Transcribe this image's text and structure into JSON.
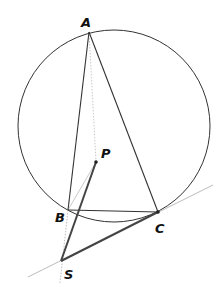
{
  "diagram": {
    "type": "geometry",
    "circle": {
      "cx": 114,
      "cy": 126,
      "r": 96,
      "stroke": "#333333"
    },
    "points": {
      "A": {
        "label": "A",
        "x": 89,
        "y": 32
      },
      "B": {
        "label": "B",
        "x": 68,
        "y": 210
      },
      "C": {
        "label": "C",
        "x": 158,
        "y": 212
      },
      "P": {
        "label": "P",
        "x": 96,
        "y": 162
      },
      "S": {
        "label": "S",
        "x": 61,
        "y": 261
      }
    },
    "segments": [
      {
        "from": "A",
        "to": "B",
        "style": "solid"
      },
      {
        "from": "A",
        "to": "C",
        "style": "solid"
      },
      {
        "from": "B",
        "to": "C",
        "style": "solid"
      },
      {
        "from": "S",
        "to": "C",
        "style": "thick"
      },
      {
        "from": "S",
        "to": "P",
        "style": "thick"
      },
      {
        "from": "A",
        "to": "P",
        "style": "faint-dotted"
      },
      {
        "from": "P",
        "to": "B",
        "style": "faint"
      },
      {
        "from": "B",
        "to": "S",
        "style": "faint-dotted"
      }
    ],
    "lines": [
      {
        "name": "tangent-at-C",
        "through": [
          "S",
          "C"
        ],
        "style": "faint"
      }
    ],
    "colors": {
      "stroke": "#333333",
      "thick": "#444444",
      "faint": "#aaaaaa"
    }
  }
}
